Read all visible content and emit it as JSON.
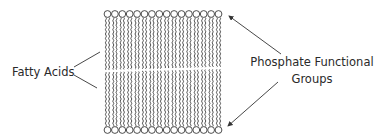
{
  "diagram": {
    "labels": {
      "fatty_acids": "Fatty Acids",
      "phosphate_line1": "Phosphate Functional",
      "phosphate_line2": "Groups"
    },
    "bilayer": {
      "heads_per_leaflet": 16,
      "leaflets": [
        "top",
        "bottom"
      ],
      "head_shape": "circle",
      "tail_shape": "wavy-line"
    },
    "pointers": [
      {
        "from": "fatty_acids",
        "to": "top-leaflet-tails",
        "style": "line"
      },
      {
        "from": "fatty_acids",
        "to": "bottom-leaflet-tails",
        "style": "line"
      },
      {
        "from": "phosphate_groups",
        "to": "top-leaflet-heads",
        "style": "arrow"
      },
      {
        "from": "phosphate_groups",
        "to": "bottom-leaflet-heads",
        "style": "arrow"
      }
    ],
    "colors": {
      "stroke": "#3a3a3a",
      "text": "#2a2a2a",
      "background": "#ffffff"
    }
  }
}
